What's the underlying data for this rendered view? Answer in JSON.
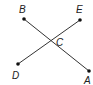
{
  "diagram": {
    "colors": {
      "line": "#333333",
      "point": "#111111",
      "label": "#222222",
      "background": "#ffffff"
    },
    "points": {
      "A": {
        "label": "A",
        "x": 89,
        "y": 71
      },
      "B": {
        "label": "B",
        "x": 24,
        "y": 19
      },
      "C": {
        "label": "C",
        "x": 51,
        "y": 42
      },
      "D": {
        "label": "D",
        "x": 18,
        "y": 64
      },
      "E": {
        "label": "E",
        "x": 80,
        "y": 20
      }
    },
    "segments": [
      {
        "name": "BA",
        "from": "B",
        "to": "A"
      },
      {
        "name": "DE",
        "from": "D",
        "to": "E"
      }
    ]
  }
}
